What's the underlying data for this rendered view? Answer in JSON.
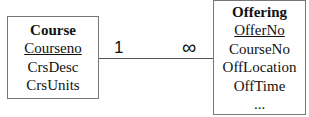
{
  "entities": {
    "course": {
      "name": "Course",
      "primary_key": "Courseno",
      "attributes": [
        "CrsDesc",
        "CrsUnits"
      ]
    },
    "offering": {
      "name": "Offering",
      "primary_key": "OfferNo",
      "attributes": [
        "CourseNo",
        "OffLocation",
        "OffTime",
        "..."
      ]
    }
  },
  "relationship": {
    "left_cardinality": "1",
    "right_cardinality": "∞"
  },
  "colors": {
    "border": "#777777",
    "line": "#555555",
    "text": "#111111"
  }
}
